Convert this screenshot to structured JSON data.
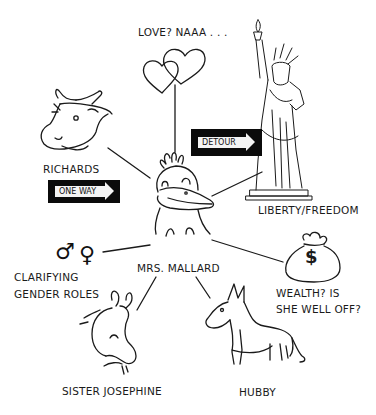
{
  "diagram": {
    "type": "mind-map",
    "center": {
      "label": "MRS. MALLARD",
      "icon": "duck-icon"
    },
    "nodes": [
      {
        "id": "love",
        "label": "LOVE? NAAA . . .",
        "icon": "hearts-icon"
      },
      {
        "id": "richards",
        "label": "RICHARDS",
        "icon": "cow-icon",
        "sign": "ONE WAY"
      },
      {
        "id": "liberty",
        "label": "LIBERTY/FREEDOM",
        "icon": "statue-of-liberty-icon",
        "sign": "DETOUR"
      },
      {
        "id": "gender",
        "label_lines": [
          "CLARIFYING",
          "GENDER ROLES"
        ],
        "icon": "gender-symbols-icon",
        "symbols": [
          "♂",
          "♀"
        ]
      },
      {
        "id": "wealth",
        "label_lines": [
          "WEALTH? IS",
          "SHE WELL OFF?"
        ],
        "icon": "money-bag-icon",
        "bag_symbol": "$"
      },
      {
        "id": "sister",
        "label": "SISTER JOSEPHINE",
        "icon": "goat-icon"
      },
      {
        "id": "hubby",
        "label": "HUBBY",
        "icon": "donkey-icon"
      }
    ],
    "edges": [
      [
        "MRS. MALLARD",
        "LOVE? NAAA . . ."
      ],
      [
        "MRS. MALLARD",
        "RICHARDS"
      ],
      [
        "MRS. MALLARD",
        "LIBERTY/FREEDOM"
      ],
      [
        "MRS. MALLARD",
        "CLARIFYING GENDER ROLES"
      ],
      [
        "MRS. MALLARD",
        "WEALTH? IS SHE WELL OFF?"
      ],
      [
        "MRS. MALLARD",
        "SISTER JOSEPHINE"
      ],
      [
        "MRS. MALLARD",
        "HUBBY"
      ]
    ]
  },
  "labels": {
    "center": "MRS. MALLARD",
    "love": "LOVE? NAAA . . .",
    "richards": "RICHARDS",
    "one_way": "ONE WAY",
    "detour": "DETOUR",
    "liberty": "LIBERTY/FREEDOM",
    "gender_1": "CLARIFYING",
    "gender_2": "GENDER ROLES",
    "male": "♂",
    "female": "♀",
    "wealth_1": "WEALTH? IS",
    "wealth_2": "SHE WELL OFF?",
    "dollar": "$",
    "sister": "SISTER JOSEPHINE",
    "hubby": "HUBBY"
  }
}
